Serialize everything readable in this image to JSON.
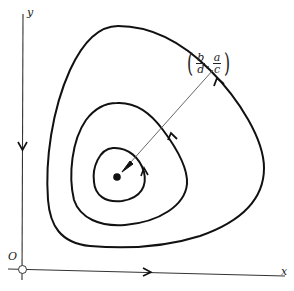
{
  "figure": {
    "axes": {
      "x_label": "x",
      "y_label": "y",
      "origin_label": "O"
    },
    "equilibrium": {
      "label_open": "(",
      "label_close": ")",
      "x_num": "b",
      "x_den": "d",
      "y_num": "a",
      "y_den": "c",
      "separator": ","
    },
    "orbits": [
      "inner",
      "middle",
      "outer"
    ],
    "colors": {
      "stroke": "#111111",
      "pointer": "#555555",
      "background": "#ffffff"
    }
  }
}
